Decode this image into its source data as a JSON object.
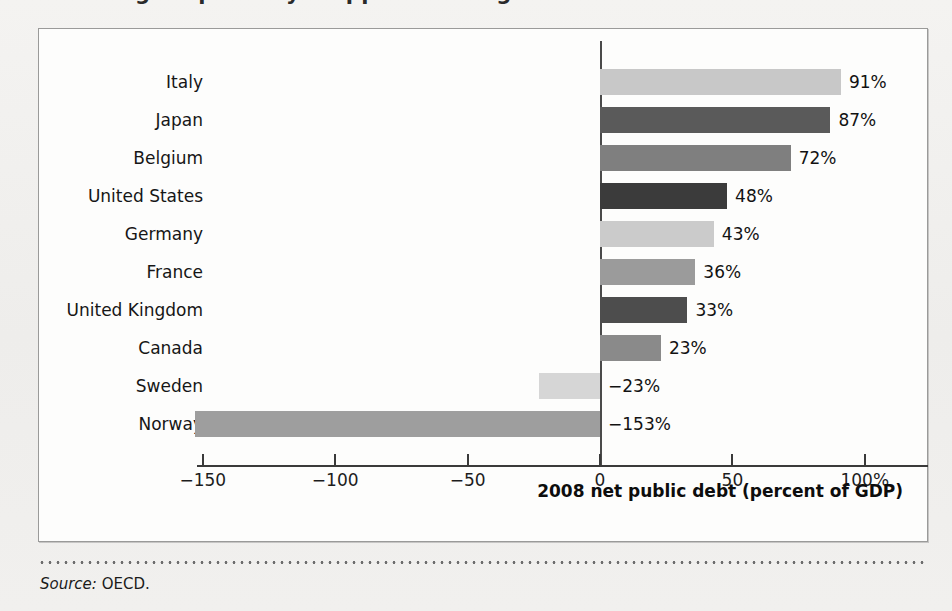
{
  "page": {
    "clipped_headline": "figure partially cropped heading"
  },
  "footer": {
    "source_label": "Source:",
    "source_value": " OECD."
  },
  "chart_data": {
    "type": "bar",
    "orientation": "horizontal",
    "title": "",
    "xlabel": "2008 net public debt (percent of GDP)",
    "ylabel": "",
    "xlim": [
      -165,
      110
    ],
    "xticks": [
      -150,
      -100,
      -50,
      0,
      50,
      100
    ],
    "xtick_labels": [
      "−150",
      "−100",
      "−50",
      "0",
      "50",
      "100%"
    ],
    "grid": false,
    "legend": "none",
    "categories": [
      "Italy",
      "Japan",
      "Belgium",
      "United States",
      "Germany",
      "France",
      "United Kingdom",
      "Canada",
      "Sweden",
      "Norway"
    ],
    "values": [
      91,
      87,
      72,
      48,
      43,
      36,
      33,
      23,
      -23,
      -153
    ],
    "value_labels": [
      "91%",
      "87%",
      "72%",
      "48%",
      "43%",
      "36%",
      "33%",
      "23%",
      "−23%",
      "−153%"
    ],
    "bar_colors": [
      "#c8c8c8",
      "#5a5a5a",
      "#7f7f7f",
      "#3b3b3b",
      "#cbcbcb",
      "#9b9b9b",
      "#4d4d4d",
      "#8a8a8a",
      "#d6d6d6",
      "#9e9e9e"
    ]
  }
}
